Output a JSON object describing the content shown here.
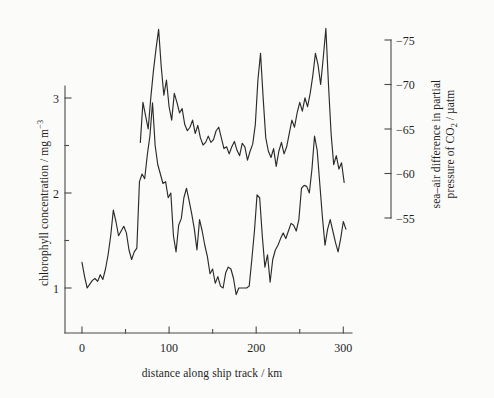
{
  "figure": {
    "background": "#fbfbf9",
    "line_color": "#2b2b2b",
    "axis_color": "#4a4a4a"
  },
  "axes": {
    "x": {
      "label": "distance along ship track / km",
      "ticks": [
        0,
        100,
        200,
        300
      ],
      "tick_labels": [
        "0",
        "100",
        "200",
        "300"
      ],
      "minor_ticks": [
        50,
        150,
        250
      ],
      "min": -8,
      "max": 310
    },
    "y_left": {
      "label_main": "chlorophyll concentration / mg m",
      "label_exponent": "−3",
      "ticks": [
        1,
        2,
        3
      ],
      "tick_labels": [
        "1",
        "2",
        "3"
      ],
      "minor_ticks": [
        1.5,
        2.5
      ],
      "min": 0.55,
      "max": 3.35
    },
    "y_right": {
      "label_line1": "sea–air difference in partial",
      "label_line2_a": "pressure of CO",
      "label_line2_sub": "2",
      "label_line2_b": " / µatm",
      "ticks": [
        -75,
        -70,
        -65,
        -60,
        -55
      ],
      "tick_labels": [
        "−75",
        "−70",
        "−65",
        "−60",
        "−55"
      ],
      "min": -53.2,
      "max": -76.6
    }
  },
  "chart_data": {
    "type": "line",
    "title": "",
    "xlabel": "distance along ship track / km",
    "ylabel": "chlorophyll concentration / mg m-3",
    "ylabel_right": "sea-air difference in partial pressure of CO2 / uatm",
    "xlim": [
      -8,
      310
    ],
    "ylim": [
      0.55,
      3.35
    ],
    "ylim_right": [
      -53.2,
      -76.6
    ],
    "grid": false,
    "legend": "none",
    "series": [
      {
        "name": "chlorophyll concentration",
        "axis": "left",
        "units": "mg m-3",
        "x": [
          0,
          3,
          6,
          9,
          12,
          15,
          18,
          21,
          24,
          27,
          30,
          33,
          36,
          39,
          42,
          45,
          48,
          51,
          54,
          57,
          60,
          63,
          66,
          69,
          72,
          75,
          78,
          81,
          84,
          87,
          90,
          93,
          96,
          99,
          102,
          105,
          108,
          111,
          114,
          117,
          120,
          123,
          126,
          129,
          132,
          135,
          138,
          141,
          144,
          147,
          150,
          153,
          156,
          159,
          162,
          165,
          168,
          171,
          174,
          177,
          180,
          183,
          186,
          189,
          192,
          195,
          198,
          201,
          204,
          207,
          210,
          213,
          216,
          219,
          222,
          225,
          228,
          231,
          234,
          237,
          240,
          243,
          246,
          249,
          252,
          255,
          258,
          261,
          264,
          267,
          270,
          273,
          276,
          279,
          282,
          285,
          288,
          291,
          294,
          297,
          300,
          303
        ],
        "y": [
          1.27,
          1.12,
          1.0,
          1.04,
          1.08,
          1.1,
          1.07,
          1.14,
          1.09,
          1.2,
          1.35,
          1.55,
          1.82,
          1.7,
          1.55,
          1.6,
          1.65,
          1.58,
          1.4,
          1.3,
          1.38,
          1.42,
          2.12,
          2.2,
          2.15,
          2.4,
          2.6,
          2.95,
          2.5,
          2.3,
          2.2,
          2.1,
          2.12,
          1.95,
          2.0,
          1.55,
          1.38,
          1.66,
          1.73,
          1.95,
          2.05,
          1.92,
          1.78,
          1.62,
          1.4,
          1.72,
          1.6,
          1.45,
          1.33,
          1.15,
          1.2,
          1.05,
          1.12,
          1.02,
          1.0,
          1.16,
          1.22,
          1.2,
          1.1,
          0.93,
          1.0,
          1.0,
          1.0,
          1.0,
          1.02,
          1.3,
          1.6,
          1.98,
          1.95,
          1.55,
          1.22,
          1.35,
          1.06,
          1.3,
          1.4,
          1.45,
          1.52,
          1.58,
          1.52,
          1.6,
          1.68,
          1.66,
          1.6,
          1.72,
          2.05,
          2.08,
          2.07,
          2.0,
          2.25,
          2.6,
          2.45,
          2.1,
          1.75,
          1.45,
          1.62,
          1.72,
          1.6,
          1.48,
          1.38,
          1.52,
          1.7,
          1.62
        ],
        "comment": "starts at x=0"
      },
      {
        "name": "sea-air pCO2 difference",
        "axis": "right",
        "units": "uatm",
        "x": [
          67,
          70,
          73,
          76,
          79,
          82,
          85,
          88,
          91,
          94,
          97,
          100,
          103,
          106,
          109,
          112,
          115,
          118,
          121,
          124,
          127,
          130,
          133,
          136,
          139,
          142,
          145,
          148,
          151,
          154,
          157,
          160,
          163,
          166,
          169,
          172,
          175,
          178,
          181,
          184,
          187,
          190,
          193,
          196,
          199,
          202,
          205,
          208,
          211,
          214,
          217,
          220,
          223,
          226,
          229,
          232,
          235,
          238,
          241,
          244,
          247,
          250,
          253,
          256,
          259,
          262,
          265,
          268,
          271,
          274,
          277,
          280,
          283,
          286,
          289,
          292,
          295,
          298,
          301
        ],
        "y": [
          -63.5,
          -68.0,
          -66.5,
          -65.0,
          -68.5,
          -71.5,
          -74.0,
          -76.2,
          -72.0,
          -68.8,
          -70.5,
          -67.5,
          -66.0,
          -69.0,
          -68.0,
          -66.8,
          -67.3,
          -65.5,
          -64.8,
          -65.2,
          -66.0,
          -64.5,
          -65.4,
          -64.0,
          -63.2,
          -63.5,
          -64.2,
          -63.5,
          -63.8,
          -64.8,
          -65.2,
          -64.0,
          -62.8,
          -63.0,
          -62.2,
          -63.0,
          -63.6,
          -62.6,
          -62.0,
          -63.4,
          -63.0,
          -61.5,
          -62.5,
          -63.3,
          -65.5,
          -70.5,
          -73.5,
          -68.5,
          -64.0,
          -62.5,
          -61.8,
          -62.8,
          -60.8,
          -62.5,
          -63.5,
          -62.2,
          -63.0,
          -64.5,
          -66.0,
          -65.2,
          -66.8,
          -68.0,
          -67.0,
          -68.5,
          -67.5,
          -69.0,
          -71.0,
          -73.5,
          -72.2,
          -70.0,
          -73.0,
          -76.3,
          -70.0,
          -64.5,
          -61.0,
          -62.0,
          -60.5,
          -61.2,
          -59.0
        ],
        "comment": "starts at x=67"
      }
    ]
  }
}
